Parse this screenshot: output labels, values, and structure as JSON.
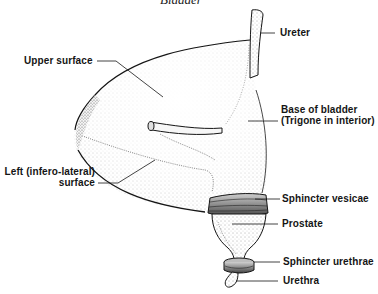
{
  "figure": {
    "cutoff_title_fragment": "Bladder",
    "colors": {
      "ink": "#151515",
      "background": "#ffffff",
      "stipple": "#3a3a3a"
    }
  },
  "labels": {
    "upper_surface": "Upper surface",
    "ureter": "Ureter",
    "base_line1": "Base of bladder",
    "base_line2": "(Trigone in interior)",
    "left_line1": "Left (infero-lateral)",
    "left_line2": "surface",
    "sphincter_vesicae": "Sphincter vesicae",
    "prostate": "Prostate",
    "sphincter_urethrae": "Sphincter urethrae",
    "urethra": "Urethra"
  }
}
